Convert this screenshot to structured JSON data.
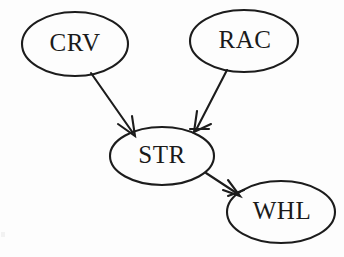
{
  "diagram": {
    "type": "directed-graph",
    "title": "",
    "background_color": "#fdfdfd",
    "ink_color": "#1c1c1c",
    "nodes": [
      {
        "id": "CRV",
        "label": "CRV",
        "shape": "ellipse",
        "cx": 75,
        "cy": 44,
        "rx": 53,
        "ry": 32
      },
      {
        "id": "RAC",
        "label": "RAC",
        "shape": "ellipse",
        "cx": 244,
        "cy": 41,
        "rx": 54,
        "ry": 31
      },
      {
        "id": "STR",
        "label": "STR",
        "shape": "ellipse",
        "cx": 162,
        "cy": 156,
        "rx": 52,
        "ry": 29
      },
      {
        "id": "WHL",
        "label": "WHL",
        "shape": "ellipse",
        "cx": 281,
        "cy": 212,
        "rx": 54,
        "ry": 31
      }
    ],
    "edges": [
      {
        "id": "crv-to-str",
        "from": "CRV",
        "to": "STR",
        "direction": "forward",
        "arrowhead": "open"
      },
      {
        "id": "rac-to-str",
        "from": "RAC",
        "to": "STR",
        "direction": "forward",
        "arrowhead": "open"
      },
      {
        "id": "str-to-whl",
        "from": "STR",
        "to": "WHL",
        "direction": "forward",
        "arrowhead": "open"
      }
    ]
  }
}
